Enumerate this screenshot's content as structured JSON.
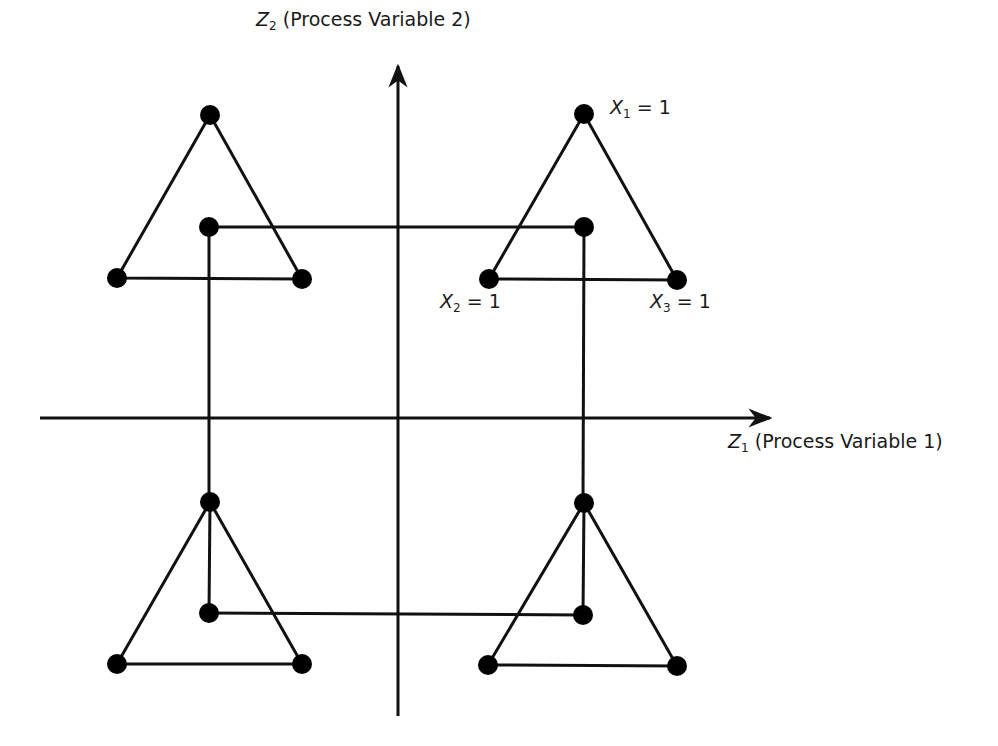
{
  "axes": {
    "y_axis": {
      "symbol": "Z",
      "subscript": "2",
      "label": "(Process Variable  2)"
    },
    "x_axis": {
      "symbol": "Z",
      "subscript": "1",
      "label": "(Process Variable  1)"
    }
  },
  "node_labels": [
    {
      "symbol": "X",
      "subscript": "1",
      "value": "= 1"
    },
    {
      "symbol": "X",
      "subscript": "2",
      "value": "= 1"
    },
    {
      "symbol": "X",
      "subscript": "3",
      "value": "= 1"
    }
  ],
  "colors": {
    "line": "#111111",
    "node": "#000000",
    "background": "#ffffff"
  },
  "triangles": [
    {
      "position": "top-left",
      "apex": [
        210,
        115
      ],
      "left": [
        117,
        278
      ],
      "right": [
        302,
        279
      ],
      "inner": [
        209,
        227
      ]
    },
    {
      "position": "top-right",
      "apex": [
        584,
        114
      ],
      "left": [
        489,
        279
      ],
      "right": [
        677,
        280
      ],
      "inner": [
        584,
        227
      ]
    },
    {
      "position": "bottom-left",
      "apex": [
        210,
        502
      ],
      "left": [
        117,
        664
      ],
      "right": [
        302,
        664
      ],
      "inner": [
        209,
        613
      ]
    },
    {
      "position": "bottom-right",
      "apex": [
        584,
        503
      ],
      "left": [
        488,
        665
      ],
      "right": [
        677,
        666
      ],
      "inner": [
        583,
        615
      ]
    }
  ]
}
